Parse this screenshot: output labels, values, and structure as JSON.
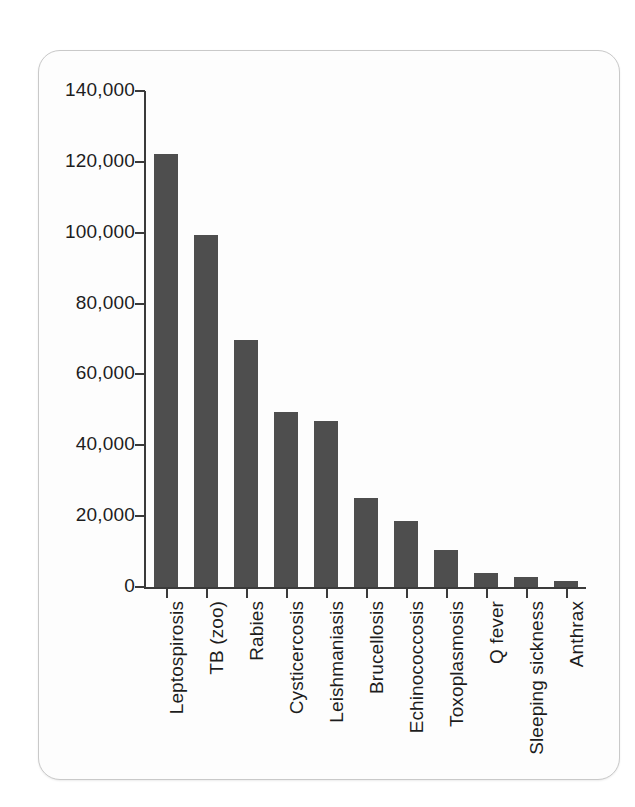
{
  "chart_data": {
    "type": "bar",
    "title": "",
    "subtitle": "",
    "xlabel": "",
    "ylabel": "",
    "ylim": [
      0,
      140000
    ],
    "ytick_interval": 20000,
    "ytick_labels": [
      "140,000",
      "120,000",
      "100,000",
      "80,000",
      "60,000",
      "40,000",
      "20,000",
      "0"
    ],
    "ytick_values": [
      140000,
      120000,
      100000,
      80000,
      60000,
      40000,
      20000,
      0
    ],
    "grid": false,
    "legend": null,
    "bar_color": "#4e4e4e",
    "axis_color": "#3a3a3a",
    "categories": [
      "Leptospirosis",
      "TB (zoo)",
      "Rabies",
      "Cysticercosis",
      "Leishmaniasis",
      "Brucellosis",
      "Echinococcosis",
      "Toxoplasmosis",
      "Q fever",
      "Sleeping sickness",
      "Anthrax"
    ],
    "values": [
      122300,
      99500,
      69800,
      49300,
      46800,
      25000,
      18500,
      10500,
      3900,
      2900,
      1700
    ]
  },
  "card": {
    "background": "#fdfdfd",
    "border_color": "#c9c9c9"
  }
}
